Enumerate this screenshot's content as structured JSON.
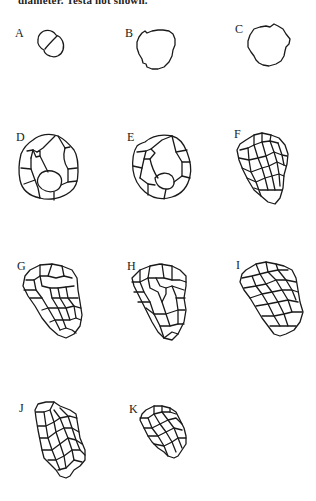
{
  "figure": {
    "caption_fragment": "diameter.  Testa not shown.",
    "panels": [
      {
        "label": "A",
        "description": "2-celled stage"
      },
      {
        "label": "B",
        "description": "single cell outline"
      },
      {
        "label": "C",
        "description": "single cell outline"
      },
      {
        "label": "D",
        "description": "multicellular ring of cells"
      },
      {
        "label": "E",
        "description": "multicellular ring of cells"
      },
      {
        "label": "F",
        "description": "elongated multicellular embryo"
      },
      {
        "label": "G",
        "description": "elongated multicellular embryo"
      },
      {
        "label": "H",
        "description": "elongated multicellular embryo"
      },
      {
        "label": "I",
        "description": "elongated multicellular embryo"
      },
      {
        "label": "J",
        "description": "elongated multicellular embryo"
      },
      {
        "label": "K",
        "description": "small multicellular embryo"
      }
    ]
  }
}
